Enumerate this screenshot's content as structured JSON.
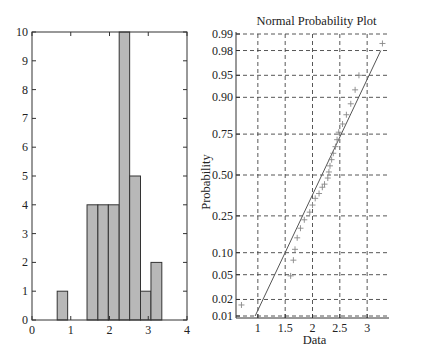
{
  "colors": {
    "bar_fill": "#b8b8b8",
    "bar_stroke": "#333333",
    "axis": "#333333",
    "grid": "#444444",
    "fit_line": "#555555",
    "marker": "#888888"
  },
  "chart_data": [
    {
      "type": "bar",
      "name": "histogram",
      "title": "",
      "xlabel": "",
      "ylabel": "",
      "xlim": [
        0,
        4
      ],
      "ylim": [
        0,
        10
      ],
      "xticks": [
        "0",
        "1",
        "2",
        "3",
        "4"
      ],
      "yticks": [
        "0",
        "1",
        "2",
        "3",
        "4",
        "5",
        "6",
        "7",
        "8",
        "9",
        "10"
      ],
      "grid": false,
      "bins": [
        {
          "x0": 0.65,
          "x1": 0.92,
          "count": 1
        },
        {
          "x0": 1.42,
          "x1": 1.7,
          "count": 4
        },
        {
          "x0": 1.7,
          "x1": 1.97,
          "count": 4
        },
        {
          "x0": 1.97,
          "x1": 2.25,
          "count": 4
        },
        {
          "x0": 2.25,
          "x1": 2.52,
          "count": 10
        },
        {
          "x0": 2.52,
          "x1": 2.8,
          "count": 5
        },
        {
          "x0": 2.8,
          "x1": 3.07,
          "count": 1
        },
        {
          "x0": 3.07,
          "x1": 3.35,
          "count": 2
        }
      ]
    },
    {
      "type": "scatter",
      "name": "normal-probability-plot",
      "title": "Normal Probability Plot",
      "xlabel": "Data",
      "ylabel": "Probability",
      "xlim": [
        0.6,
        3.4
      ],
      "xticks": [
        "1",
        "1.5",
        "2",
        "2.5",
        "3"
      ],
      "yticks": [
        "0.01",
        "0.02",
        "0.05",
        "0.10",
        "0.25",
        "0.50",
        "0.75",
        "0.90",
        "0.95",
        "0.98",
        "0.99"
      ],
      "grid": true,
      "grid_style": "dashed",
      "fit_line": {
        "x0": 0.95,
        "p0": 0.01,
        "x1": 3.25,
        "p1": 0.98
      },
      "points": [
        {
          "x": 0.7,
          "p": 0.016
        },
        {
          "x": 1.6,
          "p": 0.048
        },
        {
          "x": 1.65,
          "p": 0.08
        },
        {
          "x": 1.68,
          "p": 0.11
        },
        {
          "x": 1.72,
          "p": 0.15
        },
        {
          "x": 1.78,
          "p": 0.19
        },
        {
          "x": 1.85,
          "p": 0.23
        },
        {
          "x": 1.95,
          "p": 0.27
        },
        {
          "x": 2.0,
          "p": 0.31
        },
        {
          "x": 2.05,
          "p": 0.35
        },
        {
          "x": 2.12,
          "p": 0.38
        },
        {
          "x": 2.18,
          "p": 0.42
        },
        {
          "x": 2.22,
          "p": 0.44
        },
        {
          "x": 2.28,
          "p": 0.48
        },
        {
          "x": 2.3,
          "p": 0.52
        },
        {
          "x": 2.32,
          "p": 0.56
        },
        {
          "x": 2.35,
          "p": 0.6
        },
        {
          "x": 2.38,
          "p": 0.64
        },
        {
          "x": 2.42,
          "p": 0.68
        },
        {
          "x": 2.45,
          "p": 0.72
        },
        {
          "x": 2.48,
          "p": 0.76
        },
        {
          "x": 2.55,
          "p": 0.8
        },
        {
          "x": 2.62,
          "p": 0.84
        },
        {
          "x": 2.7,
          "p": 0.88
        },
        {
          "x": 2.78,
          "p": 0.92
        },
        {
          "x": 2.85,
          "p": 0.95
        },
        {
          "x": 3.28,
          "p": 0.985
        }
      ]
    }
  ]
}
